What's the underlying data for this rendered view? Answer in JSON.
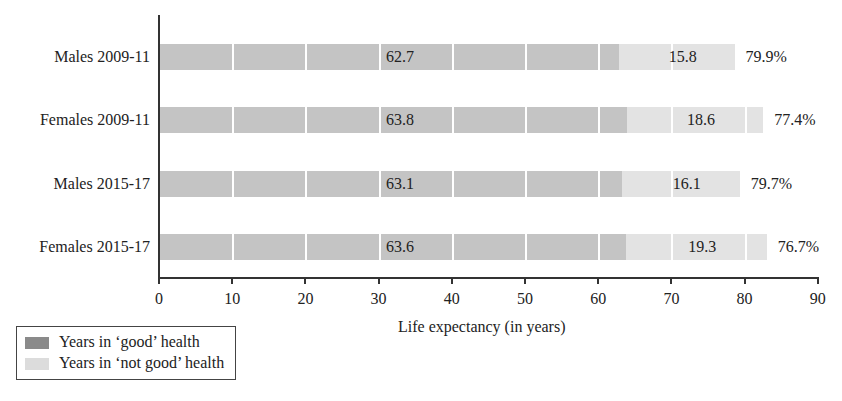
{
  "chart_data": {
    "type": "bar",
    "orientation": "horizontal",
    "stacked": true,
    "title": "",
    "xlabel": "Life expectancy (in years)",
    "ylabel": "",
    "xlim": [
      0,
      90
    ],
    "xticks": [
      0,
      10,
      20,
      30,
      40,
      50,
      60,
      70,
      80,
      90
    ],
    "categories": [
      "Males 2009-11",
      "Females 2009-11",
      "Males 2015-17",
      "Females 2015-17"
    ],
    "series": [
      {
        "name": "Years in ‘good’ health",
        "color": "#c4c4c4",
        "values": [
          62.7,
          63.8,
          63.1,
          63.6
        ]
      },
      {
        "name": "Years in ‘not good’ health",
        "color": "#e3e3e3",
        "values": [
          15.8,
          18.6,
          16.1,
          19.3
        ]
      }
    ],
    "annotations": [
      "79.9%",
      "77.4%",
      "79.7%",
      "76.7%"
    ],
    "grid": false,
    "legend_position": "bottom-left"
  },
  "axis": {
    "ticks": [
      "0",
      "10",
      "20",
      "30",
      "40",
      "50",
      "60",
      "70",
      "80",
      "90"
    ],
    "title": "Life expectancy (in years)"
  },
  "rows": [
    {
      "label": "Males 2009-11",
      "good": "62.7",
      "notgood": "15.8",
      "pct": "79.9%"
    },
    {
      "label": "Females 2009-11",
      "good": "63.8",
      "notgood": "18.6",
      "pct": "77.4%"
    },
    {
      "label": "Males 2015-17",
      "good": "63.1",
      "notgood": "16.1",
      "pct": "79.7%"
    },
    {
      "label": "Females 2015-17",
      "good": "63.6",
      "notgood": "19.3",
      "pct": "76.7%"
    }
  ],
  "legend": {
    "good": "Years in ‘good’ health",
    "notgood": "Years in ‘not good’ health",
    "good_color": "#8a8a8a",
    "notgood_color": "#dcdcdc"
  }
}
